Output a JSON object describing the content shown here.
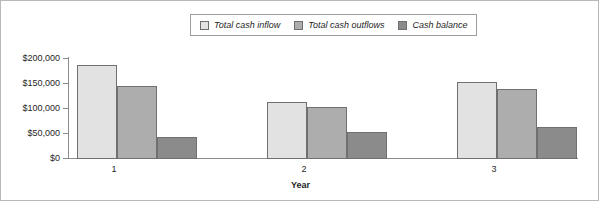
{
  "chart_data": {
    "type": "bar",
    "title": "",
    "xlabel": "Year",
    "ylabel": "",
    "categories": [
      "1",
      "2",
      "3"
    ],
    "series": [
      {
        "name": "Total cash inflow",
        "color": "#e2e2e2",
        "values": [
          186000,
          113000,
          152000
        ]
      },
      {
        "name": "Total cash outflows",
        "color": "#adadad",
        "values": [
          144000,
          102000,
          139000
        ]
      },
      {
        "name": "Cash balance",
        "color": "#8b8b8b",
        "values": [
          43000,
          54000,
          63000
        ]
      }
    ],
    "ylim": [
      0,
      200000
    ],
    "yticks": [
      0,
      50000,
      100000,
      150000,
      200000
    ],
    "ytick_labels": [
      "$0",
      "$50,000",
      "$100,000",
      "$150,000",
      "$200,000"
    ],
    "grid": false,
    "legend_position": "top-center",
    "border": true
  },
  "legend": {
    "entries": [
      {
        "label": "Total cash inflow"
      },
      {
        "label": "Total cash outflows"
      },
      {
        "label": "Cash balance"
      }
    ]
  },
  "axes": {
    "x_title": "Year",
    "x_tick_labels": [
      "1",
      "2",
      "3"
    ],
    "y_tick_labels": [
      "$200,000",
      "$150,000",
      "$100,000",
      "$50,000",
      "$0"
    ]
  },
  "colors": {
    "series_1": "#e2e2e2",
    "series_2": "#adadad",
    "series_3": "#8b8b8b",
    "axis": "#8c8c8c",
    "frame": "#b8b8b8",
    "text": "#1f1f1f"
  }
}
